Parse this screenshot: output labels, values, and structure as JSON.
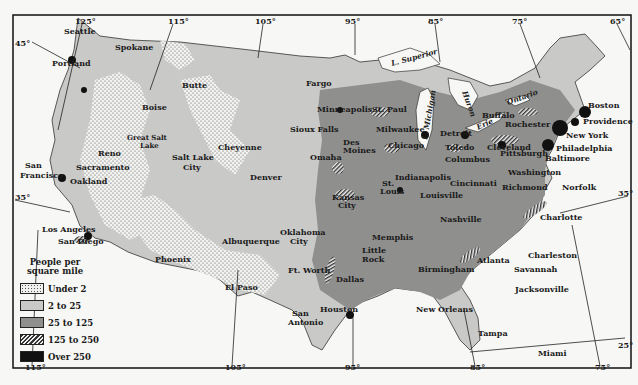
{
  "legend": {
    "title": "People per square mile",
    "items": [
      {
        "label": "Under 2",
        "pattern": "dotted",
        "color": "#f0f0ee"
      },
      {
        "label": "2 to 25",
        "pattern": "solid-light",
        "color": "#c9c9c7"
      },
      {
        "label": "25 to 125",
        "pattern": "solid-medium",
        "color": "#8f8f8d"
      },
      {
        "label": "125 to 250",
        "pattern": "hatched",
        "color": "#555555"
      },
      {
        "label": "Over 250",
        "pattern": "solid-dark",
        "color": "#111111"
      }
    ]
  },
  "graticule": {
    "longitudes_top": [
      "125°",
      "115°",
      "105°",
      "95°",
      "85°",
      "75°",
      "65°"
    ],
    "longitudes_bottom": [
      "115°",
      "105°",
      "95°",
      "85°",
      "75°"
    ],
    "latitudes": [
      "45°",
      "35°",
      "25°"
    ]
  },
  "lakes": [
    "L. Superior",
    "L. Michigan",
    "L. Huron",
    "Erie",
    "Ontario"
  ],
  "cities": {
    "west": [
      "Seattle",
      "Portland",
      "Spokane",
      "Butte",
      "Boise",
      "Reno",
      "Sacramento",
      "San Francisco",
      "Oakland",
      "Great Salt Lake",
      "Salt Lake City",
      "Los Angeles",
      "San Diego",
      "Phoenix"
    ],
    "mountain": [
      "Cheyenne",
      "Denver",
      "Albuquerque",
      "El Paso"
    ],
    "central": [
      "Fargo",
      "Minneapolis",
      "St. Paul",
      "Sioux Falls",
      "Omaha",
      "Des Moines",
      "Kansas City",
      "Oklahoma City",
      "Ft. Worth",
      "Dallas",
      "San Antonio",
      "Houston",
      "St. Louis",
      "Little Rock",
      "Memphis",
      "New Orleans"
    ],
    "east": [
      "Milwaukee",
      "Chicago",
      "Detroit",
      "Toledo",
      "Indianapolis",
      "Columbus",
      "Cincinnati",
      "Louisville",
      "Nashville",
      "Birmingham",
      "Atlanta",
      "Cleveland",
      "Buffalo",
      "Rochester",
      "Pittsburgh",
      "Washington",
      "Richmond",
      "Norfolk",
      "Charlotte",
      "Charleston",
      "Savannah",
      "Jacksonville",
      "Tampa",
      "Miami",
      "Baltimore",
      "Philadelphia",
      "New York",
      "Providence",
      "Boston"
    ]
  }
}
